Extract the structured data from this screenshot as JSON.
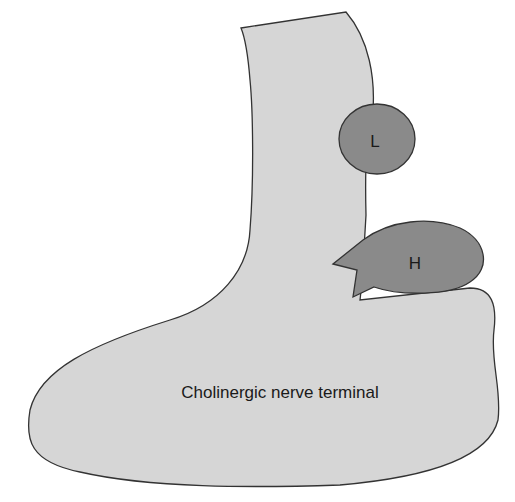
{
  "diagram": {
    "terminal_label": "Cholinergic nerve terminal",
    "receptor_low_label": "L",
    "receptor_high_label": "H",
    "colors": {
      "terminal_fill": "#d6d6d6",
      "receptor_fill": "#8a8a8a",
      "stroke": "#333333",
      "background": "#ffffff"
    }
  }
}
